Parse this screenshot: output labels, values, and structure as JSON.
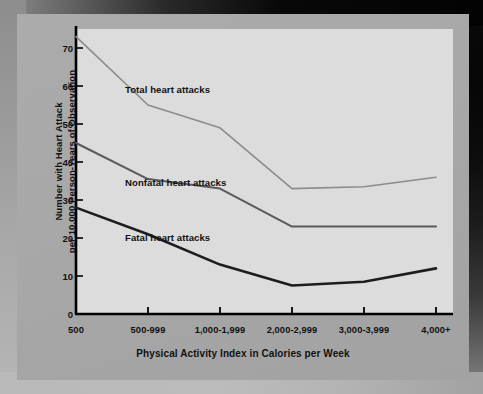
{
  "figure": {
    "background_color": "#a9a9a9",
    "plot_background_color": "#dcdcdc",
    "axis_color": "#000000"
  },
  "chart_data": {
    "type": "line",
    "title": "",
    "xlabel": "Physical Activity Index in Calories per Week",
    "ylabel_line1": "Number with Heart Attack",
    "ylabel_line2": "per 10,000 Person-Years of Observation",
    "categories": [
      "500",
      "500-999",
      "1,000-1,999",
      "2,000-2,999",
      "3,000-3,999",
      "4,000+"
    ],
    "xtick_labels": [
      "500",
      "500-999",
      "1,000-1,999",
      "2,000-2,999",
      "3,000-3,999",
      "4,000+"
    ],
    "ytick_labels": [
      "0",
      "10",
      "20",
      "30",
      "40",
      "50",
      "60",
      "70"
    ],
    "ytick_values": [
      0,
      10,
      20,
      30,
      40,
      50,
      60,
      70
    ],
    "ylim": [
      0,
      75
    ],
    "grid": false,
    "legend": "inline-annotations",
    "series": [
      {
        "name": "Total heart attacks",
        "values": [
          73,
          55,
          49,
          33,
          33.5,
          36
        ],
        "color": "#8c8c8c",
        "width": 1.6,
        "label_x": 108,
        "label_y": 70
      },
      {
        "name": "Nonfatal heart attacks",
        "values": [
          45,
          35.5,
          33,
          23,
          23,
          23
        ],
        "color": "#5a5a5a",
        "width": 2.0,
        "label_x": 108,
        "label_y": 163
      },
      {
        "name": "Fatal heart attacks",
        "values": [
          28,
          21,
          13,
          7.5,
          8.5,
          12
        ],
        "color": "#1d1d1d",
        "width": 2.6,
        "label_x": 108,
        "label_y": 218
      }
    ]
  }
}
